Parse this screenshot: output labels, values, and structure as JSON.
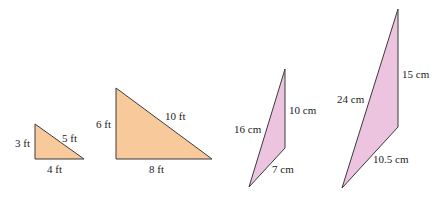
{
  "figure": {
    "colors": {
      "orange_fill": "#F8C99B",
      "pink_fill": "#ECC4DF",
      "stroke": "#3a3a3a",
      "text": "#222222"
    },
    "triangles": [
      {
        "name": "small-right-triangle",
        "labels": {
          "left": "3 ft",
          "hypotenuse": "5 ft",
          "bottom": "4 ft"
        }
      },
      {
        "name": "large-right-triangle",
        "labels": {
          "left": "6 ft",
          "hypotenuse": "10 ft",
          "bottom": "8 ft"
        }
      },
      {
        "name": "small-obtuse-triangle",
        "labels": {
          "right": "10 cm",
          "left": "16 cm",
          "bottom": "7 cm"
        }
      },
      {
        "name": "large-obtuse-triangle",
        "labels": {
          "right": "15 cm",
          "left": "24 cm",
          "bottom": "10.5 cm"
        }
      }
    ]
  }
}
